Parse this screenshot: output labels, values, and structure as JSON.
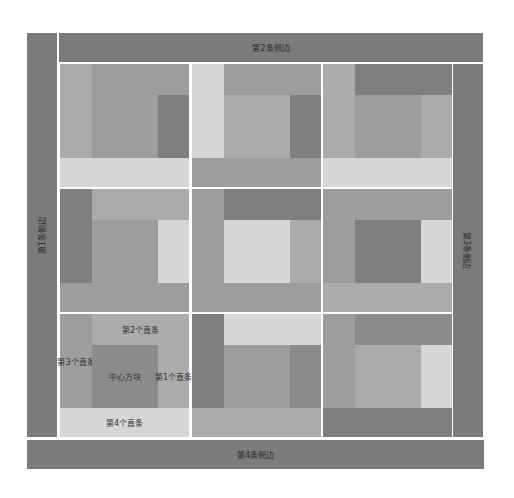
{
  "frame": {
    "top": {
      "label": "第2条侧边"
    },
    "left": {
      "label": "第1条侧边"
    },
    "right": {
      "label": "第3条侧边"
    },
    "bottom": {
      "label": "第4条侧边"
    }
  },
  "colors": {
    "frame": "#7b7b7b",
    "dark": "#7f7f7f",
    "mdark": "#8b8b8b",
    "med": "#9d9d9d",
    "mlight": "#ababab",
    "light": "#d6d6d6"
  },
  "cells": [
    {
      "name": "top-left",
      "left": "mlight",
      "top": "med",
      "center": "med",
      "right": "dark",
      "bottom": "light"
    },
    {
      "name": "top-center",
      "left": "light",
      "top": "med",
      "center": "mlight",
      "right": "dark",
      "bottom": "med"
    },
    {
      "name": "top-right",
      "left": "mlight",
      "top": "dark",
      "center": "med",
      "right": "mlight",
      "bottom": "light"
    },
    {
      "name": "middle-left",
      "left": "dark",
      "top": "mlight",
      "center": "med",
      "right": "light",
      "bottom": "med"
    },
    {
      "name": "middle-center",
      "left": "med",
      "top": "dark",
      "center": "light",
      "right": "mlight",
      "bottom": "med"
    },
    {
      "name": "middle-right",
      "left": "med",
      "top": "med",
      "center": "dark",
      "right": "light",
      "bottom": "mlight"
    },
    {
      "name": "bottom-left",
      "left": "med",
      "top": "mlight",
      "center": "mdark",
      "right": "mlight",
      "bottom": "light",
      "labels": {
        "left": "第3个直条",
        "top": "第2个直条",
        "center": "中心方块",
        "right": "第1个直条",
        "bottom": "第4个直条"
      }
    },
    {
      "name": "bottom-center",
      "left": "dark",
      "top": "light",
      "center": "med",
      "right": "mdark",
      "bottom": "mlight"
    },
    {
      "name": "bottom-right",
      "left": "med",
      "top": "mdark",
      "center": "mlight",
      "right": "light",
      "bottom": "dark"
    }
  ]
}
